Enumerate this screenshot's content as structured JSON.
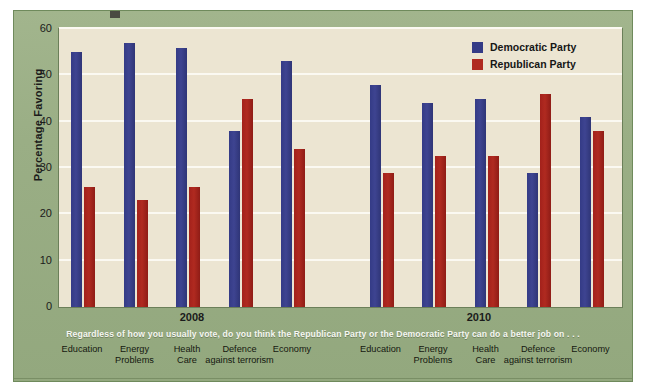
{
  "chart_data": {
    "type": "bar",
    "title": "",
    "xlabel": "",
    "ylabel": "Percentage Favoring",
    "ylim": [
      0,
      60
    ],
    "yticks": [
      0,
      10,
      20,
      30,
      40,
      50,
      60
    ],
    "grid": true,
    "legend_position": "top-right",
    "group_labels": [
      "2008",
      "2010"
    ],
    "categories": [
      "Education",
      "Energy Problems",
      "Health Care",
      "Defence against terrorism",
      "Economy"
    ],
    "category_lines": [
      [
        "Education",
        ""
      ],
      [
        "Energy",
        "Problems"
      ],
      [
        "Health",
        "Care"
      ],
      [
        "Defence",
        "against terrorism"
      ],
      [
        "Economy",
        ""
      ]
    ],
    "series": [
      {
        "name": "Democratic Party",
        "color": "#343b86",
        "values_2008": [
          55,
          57,
          56,
          38,
          53
        ],
        "values_2010": [
          48,
          44,
          45,
          29,
          41
        ]
      },
      {
        "name": "Republican Party",
        "color": "#b02a20",
        "values_2008": [
          26,
          23,
          26,
          45,
          34
        ],
        "values_2010": [
          29,
          32.5,
          32.5,
          46,
          38
        ]
      }
    ],
    "annotation": "Regardless of how you usually vote, do you think the Republican Party or the Democratic Party can do a better job on . . ."
  },
  "axis": {
    "y_label": "Percentage Favoring",
    "ticks": [
      "60",
      "50",
      "40",
      "30",
      "20",
      "10",
      "0"
    ]
  },
  "legend": {
    "items": [
      {
        "label": "Democratic Party",
        "color": "#343b86"
      },
      {
        "label": "Republican Party",
        "color": "#b02a20"
      }
    ]
  },
  "groups": {
    "left": "2008",
    "right": "2010"
  },
  "caption": {
    "text": "Regardless of how you usually vote, do you think the Republican Party or the Democratic Party can do a better job on . . ."
  },
  "categories_left": [
    {
      "line1": "Education",
      "line2": ""
    },
    {
      "line1": "Energy",
      "line2": "Problems"
    },
    {
      "line1": "Health",
      "line2": "Care"
    },
    {
      "line1": "Defence",
      "line2": "against terrorism"
    },
    {
      "line1": "Economy",
      "line2": ""
    }
  ],
  "categories_right": [
    {
      "line1": "Education",
      "line2": ""
    },
    {
      "line1": "Energy",
      "line2": "Problems"
    },
    {
      "line1": "Health",
      "line2": "Care"
    },
    {
      "line1": "Defence",
      "line2": "against terrorism"
    },
    {
      "line1": "Economy",
      "line2": ""
    }
  ],
  "colors": {
    "democratic": "#343b86",
    "republican": "#b02a20",
    "frame": "#9cb087",
    "plot_background": "#ece5d2"
  }
}
